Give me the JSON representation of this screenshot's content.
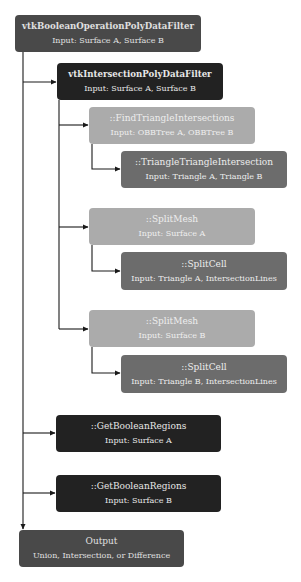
{
  "diagram": {
    "type": "flowchart",
    "colors": {
      "top_level": "#494949",
      "primary": "#222222",
      "secondary": "#ababab",
      "tertiary": "#6c6c6c",
      "connector": "#1a1a1a"
    },
    "nodes": [
      {
        "id": "boolean_filter",
        "title": "vtkBooleanOperationPolyDataFilter",
        "subtitle": "Input: Surface A, Surface B"
      },
      {
        "id": "intersection_filter",
        "title": "vtkIntersectionPolyDataFilter",
        "subtitle": "Input: Surface A, Surface B"
      },
      {
        "id": "find_triangle_intersections",
        "title": "::FindTriangleIntersections",
        "subtitle": "Input: OBBTree A, OBBTree B"
      },
      {
        "id": "triangle_triangle_intersection",
        "title": "::TriangleTriangleIntersection",
        "subtitle": "Input: Triangle A, Triangle B"
      },
      {
        "id": "split_mesh_a",
        "title": "::SplitMesh",
        "subtitle": "Input: Surface A"
      },
      {
        "id": "split_cell_a",
        "title": "::SplitCell",
        "subtitle": "Input: Triangle A, IntersectionLines"
      },
      {
        "id": "split_mesh_b",
        "title": "::SplitMesh",
        "subtitle": "Input: Surface B"
      },
      {
        "id": "split_cell_b",
        "title": "::SplitCell",
        "subtitle": "Input: Triangle B, IntersectionLines"
      },
      {
        "id": "get_boolean_regions_a",
        "title": "::GetBooleanRegions",
        "subtitle": "Input: Surface A"
      },
      {
        "id": "get_boolean_regions_b",
        "title": "::GetBooleanRegions",
        "subtitle": "Input: Surface B"
      },
      {
        "id": "output",
        "title": "Output",
        "subtitle": "Union, Intersection, or Difference"
      }
    ],
    "edges": [
      {
        "from": "boolean_filter",
        "to": "intersection_filter"
      },
      {
        "from": "intersection_filter",
        "to": "find_triangle_intersections"
      },
      {
        "from": "find_triangle_intersections",
        "to": "triangle_triangle_intersection"
      },
      {
        "from": "intersection_filter",
        "to": "split_mesh_a"
      },
      {
        "from": "split_mesh_a",
        "to": "split_cell_a"
      },
      {
        "from": "intersection_filter",
        "to": "split_mesh_b"
      },
      {
        "from": "split_mesh_b",
        "to": "split_cell_b"
      },
      {
        "from": "boolean_filter",
        "to": "get_boolean_regions_a"
      },
      {
        "from": "boolean_filter",
        "to": "get_boolean_regions_b"
      },
      {
        "from": "boolean_filter",
        "to": "output"
      }
    ]
  }
}
